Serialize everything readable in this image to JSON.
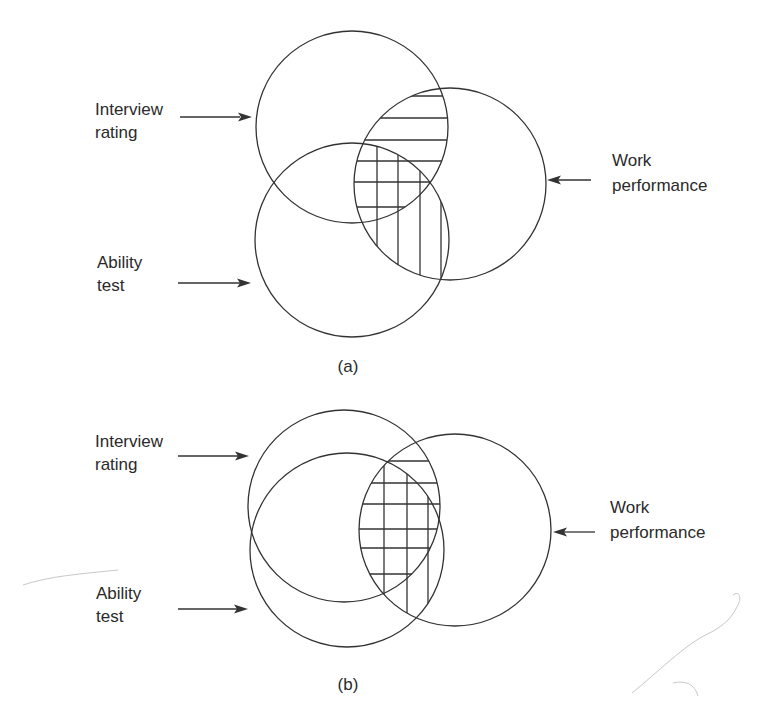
{
  "figure": {
    "panels": [
      {
        "id": "a",
        "caption": "(a)",
        "labels": {
          "interview": [
            "Interview",
            "rating"
          ],
          "ability": [
            "Ability",
            "test"
          ],
          "work": [
            "Work",
            "performance"
          ]
        },
        "hatching": {
          "interview_work_overlap": "horizontal",
          "ability_work_overlap": "vertical"
        }
      },
      {
        "id": "b",
        "caption": "(b)",
        "labels": {
          "interview": [
            "Interview",
            "rating"
          ],
          "ability": [
            "Ability",
            "test"
          ],
          "work": [
            "Work",
            "performance"
          ]
        },
        "hatching": {
          "interview_work_overlap": "horizontal",
          "ability_work_overlap": "vertical"
        }
      }
    ],
    "colors": {
      "stroke": "#333333",
      "text": "#2a2a2a",
      "background": "#ffffff"
    }
  }
}
